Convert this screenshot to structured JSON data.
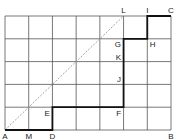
{
  "grid": {
    "cols": 7,
    "rows": 5,
    "line_color": "#555555"
  },
  "path": {
    "color": "#111111",
    "points": [
      {
        "label": "A",
        "c": 0,
        "r": 5
      },
      {
        "label": "D",
        "c": 2,
        "r": 5
      },
      {
        "label": "E",
        "c": 2,
        "r": 4
      },
      {
        "label": "F",
        "c": 5,
        "r": 4
      },
      {
        "label": "G",
        "c": 5,
        "r": 1
      },
      {
        "label": "H",
        "c": 6,
        "r": 1
      },
      {
        "label": "I",
        "c": 6,
        "r": 0
      },
      {
        "label": "C",
        "c": 7,
        "r": 0
      }
    ]
  },
  "diagonal": {
    "from": {
      "c": 0,
      "r": 5
    },
    "to": {
      "c": 5,
      "r": 0
    },
    "color": "#999999",
    "style": "dashed"
  },
  "labels": [
    {
      "text": "A",
      "c": 0,
      "r": 5,
      "pos": "below"
    },
    {
      "text": "M",
      "c": 1,
      "r": 5,
      "pos": "below"
    },
    {
      "text": "D",
      "c": 2,
      "r": 5,
      "pos": "below"
    },
    {
      "text": "B",
      "c": 7,
      "r": 5,
      "pos": "below"
    },
    {
      "text": "E",
      "c": 2,
      "r": 4,
      "pos": "below-left"
    },
    {
      "text": "F",
      "c": 5,
      "r": 4,
      "pos": "below-left"
    },
    {
      "text": "J",
      "c": 5,
      "r": 3,
      "pos": "above-left"
    },
    {
      "text": "K",
      "c": 5,
      "r": 2,
      "pos": "above-left"
    },
    {
      "text": "G",
      "c": 5,
      "r": 1,
      "pos": "below-left"
    },
    {
      "text": "H",
      "c": 6,
      "r": 1,
      "pos": "below-right"
    },
    {
      "text": "L",
      "c": 5,
      "r": 0,
      "pos": "above"
    },
    {
      "text": "I",
      "c": 6,
      "r": 0,
      "pos": "above"
    },
    {
      "text": "C",
      "c": 7,
      "r": 0,
      "pos": "above"
    }
  ]
}
